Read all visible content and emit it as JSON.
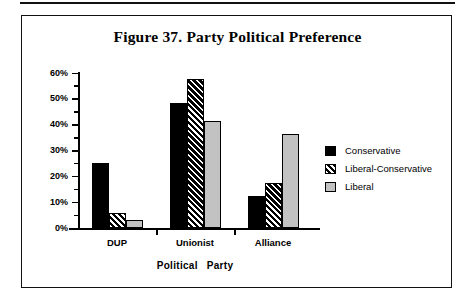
{
  "figure": {
    "title": "Figure 37. Party Political Preference"
  },
  "chart_data": {
    "type": "bar",
    "title": "Figure 37. Party Political Preference",
    "xlabel": "Political   Party",
    "ylabel": "",
    "categories": [
      "DUP",
      "Unionist",
      "Alliance"
    ],
    "series": [
      {
        "name": "Conservative",
        "values": [
          25.0,
          48.5,
          12.5
        ],
        "fill": "solid",
        "color": "#000000"
      },
      {
        "name": "Liberal-Conservative",
        "values": [
          6.0,
          57.7,
          17.5
        ],
        "fill": "hatch",
        "color": "#000000"
      },
      {
        "name": "Liberal",
        "values": [
          3.0,
          41.5,
          36.5
        ],
        "fill": "light",
        "color": "#c2c2c2"
      }
    ],
    "ylim": [
      0,
      60
    ],
    "ytick_labels": [
      "0%",
      "10%",
      "20%",
      "30%",
      "40%",
      "50%",
      "60%"
    ],
    "ytick_values": [
      0,
      10,
      20,
      30,
      40,
      50,
      60
    ],
    "yminor_values": [
      5,
      15,
      25,
      35,
      45,
      55
    ],
    "grid": false,
    "legend_position": "right",
    "value_unit": "%"
  },
  "axis": {
    "x_title_part1": "Political",
    "x_title_part2": "Party"
  }
}
